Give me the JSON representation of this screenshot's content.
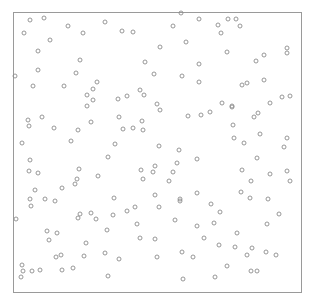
{
  "chart_data": {
    "type": "scatter",
    "title": "",
    "xlabel": "",
    "ylabel": "",
    "xlim": [
      0,
      1
    ],
    "ylim": [
      0,
      1
    ],
    "grid": false,
    "legend": null,
    "axes_ticks_visible": false,
    "marker": {
      "shape": "hollow-circle",
      "radius_px": 2,
      "stroke": "#8c8c8c",
      "fill": "none"
    },
    "frame_color": "#9a9a9a",
    "plot_box_px": {
      "left": 13,
      "top": 12,
      "right": 302,
      "bottom": 293
    },
    "points_px": [
      [
        30,
        20
      ],
      [
        44,
        18
      ],
      [
        68,
        26
      ],
      [
        105,
        22
      ],
      [
        24,
        33
      ],
      [
        83,
        33
      ],
      [
        50,
        40
      ],
      [
        38,
        51
      ],
      [
        80,
        60
      ],
      [
        38,
        70
      ],
      [
        76,
        73
      ],
      [
        15,
        76
      ],
      [
        97,
        82
      ],
      [
        33,
        86
      ],
      [
        64,
        86
      ],
      [
        93,
        89
      ],
      [
        87,
        95
      ],
      [
        93,
        100
      ],
      [
        87,
        106
      ],
      [
        181,
        13
      ],
      [
        199,
        19
      ],
      [
        122,
        31
      ],
      [
        133,
        32
      ],
      [
        173,
        26
      ],
      [
        186,
        42
      ],
      [
        160,
        47
      ],
      [
        145,
        62
      ],
      [
        199,
        64
      ],
      [
        154,
        74
      ],
      [
        182,
        76
      ],
      [
        199,
        82
      ],
      [
        140,
        90
      ],
      [
        127,
        96
      ],
      [
        144,
        95
      ],
      [
        118,
        99
      ],
      [
        157,
        104
      ],
      [
        228,
        19
      ],
      [
        236,
        19
      ],
      [
        218,
        25
      ],
      [
        240,
        26
      ],
      [
        221,
        33
      ],
      [
        287,
        48
      ],
      [
        287,
        53
      ],
      [
        227,
        52
      ],
      [
        264,
        55
      ],
      [
        256,
        61
      ],
      [
        264,
        80
      ],
      [
        242,
        85
      ],
      [
        247,
        83
      ],
      [
        222,
        103
      ],
      [
        232,
        106
      ],
      [
        270,
        103
      ],
      [
        282,
        97
      ],
      [
        290,
        96
      ],
      [
        28,
        120
      ],
      [
        42,
        117
      ],
      [
        29,
        126
      ],
      [
        91,
        122
      ],
      [
        54,
        128
      ],
      [
        78,
        130
      ],
      [
        22,
        143
      ],
      [
        71,
        141
      ],
      [
        30,
        160
      ],
      [
        108,
        157
      ],
      [
        29,
        171
      ],
      [
        38,
        173
      ],
      [
        79,
        169
      ],
      [
        98,
        176
      ],
      [
        77,
        179
      ],
      [
        75,
        184
      ],
      [
        62,
        188
      ],
      [
        35,
        190
      ],
      [
        30,
        199
      ],
      [
        45,
        199
      ],
      [
        160,
        110
      ],
      [
        119,
        117
      ],
      [
        142,
        121
      ],
      [
        188,
        116
      ],
      [
        201,
        115
      ],
      [
        123,
        129
      ],
      [
        133,
        128
      ],
      [
        143,
        130
      ],
      [
        115,
        144
      ],
      [
        159,
        146
      ],
      [
        179,
        150
      ],
      [
        197,
        159
      ],
      [
        177,
        163
      ],
      [
        155,
        166
      ],
      [
        141,
        170
      ],
      [
        153,
        172
      ],
      [
        173,
        172
      ],
      [
        143,
        179
      ],
      [
        169,
        181
      ],
      [
        197,
        193
      ],
      [
        114,
        198
      ],
      [
        155,
        195
      ],
      [
        180,
        199
      ],
      [
        232,
        107
      ],
      [
        210,
        112
      ],
      [
        258,
        113
      ],
      [
        254,
        117
      ],
      [
        233,
        125
      ],
      [
        260,
        134
      ],
      [
        234,
        138
      ],
      [
        244,
        143
      ],
      [
        287,
        138
      ],
      [
        284,
        147
      ],
      [
        257,
        158
      ],
      [
        242,
        170
      ],
      [
        270,
        174
      ],
      [
        287,
        171
      ],
      [
        251,
        181
      ],
      [
        290,
        181
      ],
      [
        241,
        192
      ],
      [
        250,
        198
      ],
      [
        268,
        199
      ],
      [
        55,
        201
      ],
      [
        31,
        206
      ],
      [
        16,
        219
      ],
      [
        80,
        214
      ],
      [
        91,
        213
      ],
      [
        78,
        218
      ],
      [
        96,
        219
      ],
      [
        107,
        230
      ],
      [
        47,
        231
      ],
      [
        57,
        233
      ],
      [
        49,
        240
      ],
      [
        86,
        243
      ],
      [
        61,
        255
      ],
      [
        56,
        257
      ],
      [
        84,
        256
      ],
      [
        105,
        253
      ],
      [
        22,
        265
      ],
      [
        23,
        271
      ],
      [
        32,
        271
      ],
      [
        40,
        270
      ],
      [
        62,
        270
      ],
      [
        73,
        268
      ],
      [
        21,
        277
      ],
      [
        108,
        276
      ],
      [
        180,
        201
      ],
      [
        135,
        207
      ],
      [
        127,
        211
      ],
      [
        159,
        207
      ],
      [
        113,
        215
      ],
      [
        175,
        220
      ],
      [
        137,
        224
      ],
      [
        197,
        226
      ],
      [
        140,
        238
      ],
      [
        155,
        239
      ],
      [
        204,
        238
      ],
      [
        119,
        259
      ],
      [
        157,
        257
      ],
      [
        182,
        252
      ],
      [
        193,
        257
      ],
      [
        183,
        279
      ],
      [
        211,
        204
      ],
      [
        220,
        212
      ],
      [
        279,
        214
      ],
      [
        214,
        223
      ],
      [
        267,
        224
      ],
      [
        237,
        233
      ],
      [
        219,
        245
      ],
      [
        235,
        247
      ],
      [
        252,
        248
      ],
      [
        247,
        255
      ],
      [
        266,
        252
      ],
      [
        276,
        255
      ],
      [
        227,
        266
      ],
      [
        251,
        271
      ],
      [
        257,
        271
      ],
      [
        215,
        277
      ]
    ],
    "point_count": 158
  }
}
